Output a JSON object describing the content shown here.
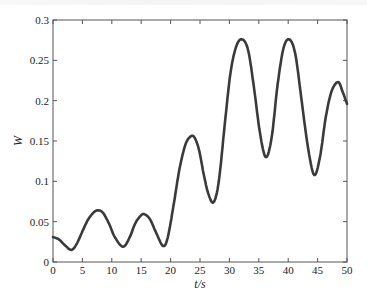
{
  "chart_data": {
    "type": "line",
    "title": "",
    "xlabel": "t/s",
    "ylabel": "W",
    "xlim": [
      0,
      50
    ],
    "ylim": [
      0,
      0.3
    ],
    "grid": false,
    "legend": null,
    "x_ticks": [
      0,
      5,
      10,
      15,
      20,
      25,
      30,
      35,
      40,
      45,
      50
    ],
    "x_tick_labels": [
      "0",
      "5",
      "10",
      "15",
      "20",
      "25",
      "30",
      "35",
      "40",
      "45",
      "50"
    ],
    "y_ticks": [
      0,
      0.05,
      0.1,
      0.15,
      0.2,
      0.25,
      0.3
    ],
    "y_tick_labels": [
      "0",
      "0.05",
      "0.1",
      "0.15",
      "0.2",
      "0.25",
      "0.3"
    ],
    "series": [
      {
        "name": "W",
        "color": "#3a3a3a",
        "x": [
          0,
          1,
          2,
          3.1,
          4,
          5,
          6,
          7,
          7.7,
          8.5,
          9.5,
          10.5,
          11.9,
          13,
          14,
          15,
          15.6,
          16.5,
          17.5,
          18.7,
          19.5,
          20.5,
          21.5,
          22.5,
          23.3,
          24.0,
          24.8,
          25.6,
          26.4,
          27.3,
          28.2,
          29.2,
          30.2,
          31.2,
          32.2,
          33.2,
          34.2,
          35.2,
          36.2,
          37.2,
          38.2,
          39.2,
          40.2,
          41.2,
          42.2,
          43.3,
          44.4,
          45.4,
          46.4,
          47.4,
          48.5,
          49.3,
          50
        ],
        "y": [
          0.031,
          0.028,
          0.021,
          0.015,
          0.022,
          0.038,
          0.053,
          0.062,
          0.064,
          0.061,
          0.048,
          0.031,
          0.019,
          0.03,
          0.048,
          0.058,
          0.059,
          0.053,
          0.037,
          0.02,
          0.03,
          0.07,
          0.115,
          0.145,
          0.155,
          0.155,
          0.14,
          0.11,
          0.085,
          0.074,
          0.1,
          0.17,
          0.235,
          0.268,
          0.276,
          0.262,
          0.215,
          0.16,
          0.13,
          0.155,
          0.22,
          0.265,
          0.276,
          0.258,
          0.205,
          0.145,
          0.108,
          0.13,
          0.18,
          0.212,
          0.223,
          0.21,
          0.196
        ]
      }
    ]
  }
}
